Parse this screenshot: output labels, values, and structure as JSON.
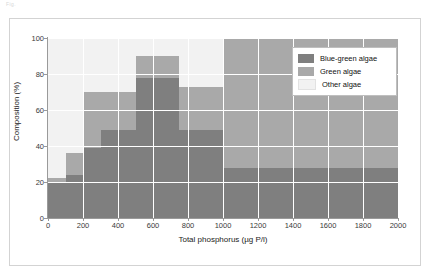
{
  "caption": "Fig.   ",
  "chart_data": {
    "type": "bar",
    "subtype": "stacked-histogram",
    "title": "",
    "xlabel": "Total phosphorus (µg P/l)",
    "ylabel": "Composition (%)",
    "xlim": [
      0,
      2000
    ],
    "ylim": [
      0,
      100
    ],
    "xticks": [
      0,
      200,
      400,
      600,
      800,
      1000,
      1200,
      1400,
      1600,
      1800,
      2000
    ],
    "xtick_labels": [
      "0",
      "200",
      "400",
      "600",
      "800",
      "1000",
      "1200",
      "1400",
      "1600",
      "1800",
      "2000"
    ],
    "yticks": [
      0,
      20,
      40,
      60,
      80,
      100
    ],
    "ytick_labels": [
      "0",
      "20",
      "40",
      "60",
      "80",
      "100"
    ],
    "grid": true,
    "legend_position": "upper right",
    "stack_order": [
      "Blue-green algae",
      "Green algae",
      "Other algae"
    ],
    "series": [
      {
        "name": "Blue-green algae",
        "color": "#7f7f7f",
        "values": [
          20,
          24,
          39,
          49,
          78,
          78,
          49,
          49,
          28,
          28,
          28,
          28,
          28
        ]
      },
      {
        "name": "Green algae",
        "color": "#a9a9a9",
        "values": [
          2,
          12,
          31,
          21,
          12,
          12,
          24,
          24,
          72,
          72,
          72,
          72,
          72
        ]
      },
      {
        "name": "Other algae",
        "color": "#f2f2f2",
        "values": [
          78,
          64,
          30,
          30,
          10,
          10,
          27,
          27,
          0,
          0,
          0,
          0,
          0
        ]
      }
    ],
    "bins": [
      {
        "x0": 0,
        "x1": 100,
        "blue_green": 20,
        "green_top": 22,
        "other_top": 100
      },
      {
        "x0": 100,
        "x1": 200,
        "blue_green": 24,
        "green_top": 36,
        "other_top": 100
      },
      {
        "x0": 200,
        "x1": 300,
        "blue_green": 39,
        "green_top": 70,
        "other_top": 100
      },
      {
        "x0": 300,
        "x1": 500,
        "blue_green": 49,
        "green_top": 70,
        "other_top": 100
      },
      {
        "x0": 500,
        "x1": 625,
        "blue_green": 78,
        "green_top": 90,
        "other_top": 100
      },
      {
        "x0": 625,
        "x1": 750,
        "blue_green": 78,
        "green_top": 90,
        "other_top": 100
      },
      {
        "x0": 750,
        "x1": 875,
        "blue_green": 49,
        "green_top": 73,
        "other_top": 100
      },
      {
        "x0": 875,
        "x1": 1000,
        "blue_green": 49,
        "green_top": 73,
        "other_top": 100
      },
      {
        "x0": 1000,
        "x1": 1200,
        "blue_green": 28,
        "green_top": 100,
        "other_top": 100
      },
      {
        "x0": 1200,
        "x1": 1400,
        "blue_green": 28,
        "green_top": 100,
        "other_top": 100
      },
      {
        "x0": 1400,
        "x1": 1600,
        "blue_green": 28,
        "green_top": 100,
        "other_top": 100
      },
      {
        "x0": 1600,
        "x1": 1800,
        "blue_green": 28,
        "green_top": 100,
        "other_top": 100
      },
      {
        "x0": 1800,
        "x1": 2000,
        "blue_green": 28,
        "green_top": 100,
        "other_top": 100
      }
    ]
  },
  "legend": {
    "items": [
      {
        "label": "Blue-green algae",
        "color": "#7f7f7f"
      },
      {
        "label": "Green algae",
        "color": "#a9a9a9"
      },
      {
        "label": "Other algae",
        "color": "#f2f2f2"
      }
    ]
  },
  "colors": {
    "blue_green_algae": "#7f7f7f",
    "green_algae": "#a9a9a9",
    "other_algae": "#f2f2f2",
    "gridline": "#ffffff",
    "axis": "#9a9a9a",
    "frame": "#d3d3d3",
    "background": "#ffffff"
  }
}
